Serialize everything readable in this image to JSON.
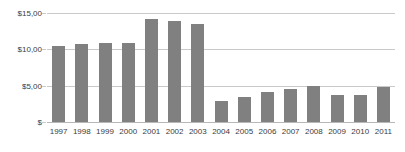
{
  "chart_data": {
    "type": "bar",
    "title": "",
    "subtitle": "",
    "xlabel": "",
    "ylabel": "",
    "categories": [
      "1997",
      "1998",
      "1999",
      "2000",
      "2001",
      "2002",
      "2003",
      "2004",
      "2005",
      "2006",
      "2007",
      "2008",
      "2009",
      "2010",
      "2011"
    ],
    "values": [
      10.5,
      10.7,
      10.9,
      10.9,
      14.2,
      13.9,
      13.5,
      2.9,
      3.4,
      4.1,
      4.5,
      4.9,
      3.7,
      3.7,
      4.8
    ],
    "series": [
      {
        "name": "",
        "values": [
          10.5,
          10.7,
          10.9,
          10.9,
          14.2,
          13.9,
          13.5,
          2.9,
          3.4,
          4.1,
          4.5,
          4.9,
          3.7,
          3.7,
          4.8
        ]
      }
    ],
    "ylim": [
      0,
      15
    ],
    "yticks": [
      0,
      5,
      10,
      15
    ],
    "ytick_labels": [
      "$",
      "$5,00",
      "$10,00",
      "$15,00"
    ],
    "grid": true,
    "legend": false,
    "legend_position": "none",
    "bar_color": "#808080",
    "gridline_color": "#c9c9c9",
    "axis_text_color": "#3b3b3b",
    "background_color": "#ffffff"
  }
}
